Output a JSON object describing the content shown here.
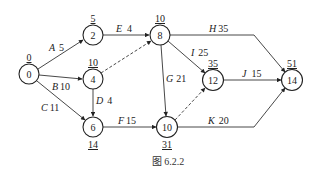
{
  "caption": "图 6.2.2",
  "nodes": [
    {
      "id": "0",
      "label": "0",
      "time": "0",
      "x": 29,
      "y": 74,
      "time_pos": "above"
    },
    {
      "id": "2",
      "label": "2",
      "time": "5",
      "x": 93,
      "y": 35,
      "time_pos": "above"
    },
    {
      "id": "4",
      "label": "4",
      "time": "10",
      "x": 93,
      "y": 79,
      "time_pos": "above"
    },
    {
      "id": "6",
      "label": "6",
      "time": "14",
      "x": 93,
      "y": 127,
      "time_pos": "below"
    },
    {
      "id": "8",
      "label": "8",
      "time": "10",
      "x": 160,
      "y": 35,
      "time_pos": "above"
    },
    {
      "id": "10",
      "label": "10",
      "time": "31",
      "x": 167,
      "y": 127,
      "time_pos": "below"
    },
    {
      "id": "12",
      "label": "12",
      "time": "35",
      "x": 213,
      "y": 80,
      "time_pos": "above"
    },
    {
      "id": "14",
      "label": "14",
      "time": "51",
      "x": 292,
      "y": 80,
      "time_pos": "above"
    }
  ],
  "edges": [
    {
      "from": "0",
      "to": "2",
      "activity": "A",
      "duration": "5",
      "dashed": false
    },
    {
      "from": "0",
      "to": "4",
      "activity": "B",
      "duration": "10",
      "dashed": false
    },
    {
      "from": "0",
      "to": "6",
      "activity": "C",
      "duration": "11",
      "dashed": false
    },
    {
      "from": "4",
      "to": "6",
      "activity": "D",
      "duration": "4",
      "dashed": false
    },
    {
      "from": "2",
      "to": "8",
      "activity": "E",
      "duration": "4",
      "dashed": false
    },
    {
      "from": "6",
      "to": "10",
      "activity": "F",
      "duration": "15",
      "dashed": false
    },
    {
      "from": "8",
      "to": "10",
      "activity": "G",
      "duration": "21",
      "dashed": false
    },
    {
      "from": "8",
      "to": "14",
      "activity": "H",
      "duration": "35",
      "dashed": false
    },
    {
      "from": "8",
      "to": "12",
      "activity": "I",
      "duration": "25",
      "dashed": false
    },
    {
      "from": "12",
      "to": "14",
      "activity": "J",
      "duration": "15",
      "dashed": false
    },
    {
      "from": "10",
      "to": "14",
      "activity": "K",
      "duration": "20",
      "dashed": false
    },
    {
      "from": "4",
      "to": "8",
      "activity": "",
      "duration": "",
      "dashed": true
    },
    {
      "from": "10",
      "to": "12",
      "activity": "",
      "duration": "",
      "dashed": true
    }
  ]
}
